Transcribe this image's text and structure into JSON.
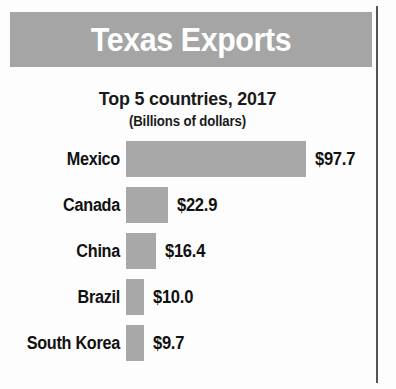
{
  "figure": {
    "title": "Texas Exports",
    "subtitle": "Top 5 countries, 2017",
    "units_note": "(Billions of dollars)"
  },
  "colors": {
    "banner_background": "#a5a5a5",
    "banner_text": "#ffffff",
    "bar_fill": "#a8a8a8",
    "text": "#111111",
    "page_background": "#fdfdfd",
    "column_rule": "#555555"
  },
  "chart_data": {
    "type": "bar",
    "orientation": "horizontal",
    "title": "Texas Exports",
    "subtitle": "Top 5 countries, 2017",
    "xlabel": "",
    "ylabel": "",
    "units": "Billions of dollars",
    "grid": false,
    "legend": false,
    "axis_visible": false,
    "xlim": [
      0,
      97.7
    ],
    "categories": [
      "Mexico",
      "Canada",
      "China",
      "Brazil",
      "South Korea"
    ],
    "values": [
      97.7,
      22.9,
      16.4,
      10.0,
      9.7
    ],
    "value_labels": [
      "$97.7",
      "$22.9",
      "$16.4",
      "$10.0",
      "$9.7"
    ],
    "rows": [
      {
        "label": "Mexico",
        "value": 97.7,
        "value_label": "$97.7"
      },
      {
        "label": "Canada",
        "value": 22.9,
        "value_label": "$22.9"
      },
      {
        "label": "China",
        "value": 16.4,
        "value_label": "$16.4"
      },
      {
        "label": "Brazil",
        "value": 10.0,
        "value_label": "$10.0"
      },
      {
        "label": "South Korea",
        "value": 9.7,
        "value_label": "$9.7"
      }
    ]
  }
}
